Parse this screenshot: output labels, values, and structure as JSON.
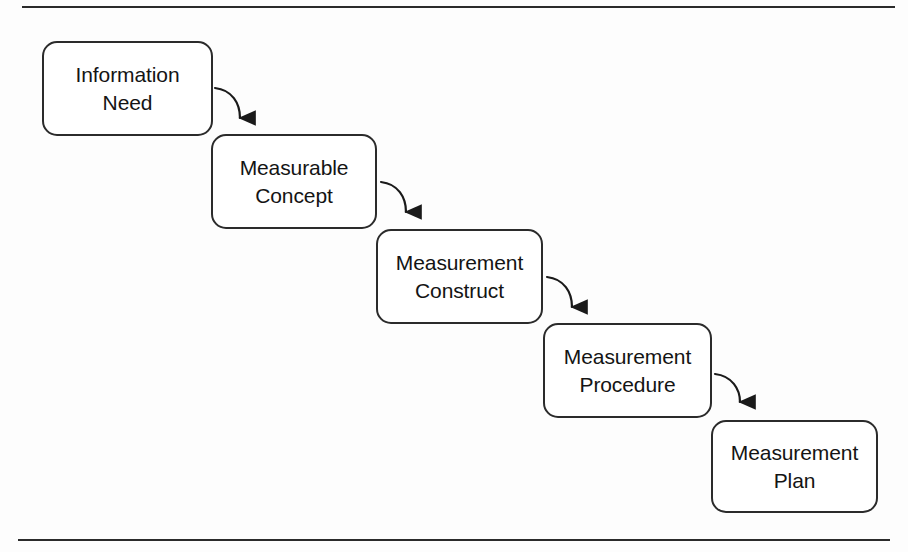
{
  "figure": {
    "background_color": "#fdfdfd",
    "line_color": "#2b2b2b",
    "text_color": "#141414"
  },
  "rules": [
    {
      "name": "top-rule",
      "label": "top horizontal rule"
    },
    {
      "name": "bottom-rule",
      "label": "bottom horizontal rule"
    }
  ],
  "nodes": [
    {
      "id": "information-need",
      "label": "Information\nNeed",
      "line1": "Information",
      "line2": "Need"
    },
    {
      "id": "measurable-concept",
      "label": "Measurable\nConcept",
      "line1": "Measurable",
      "line2": "Concept"
    },
    {
      "id": "measurement-construct",
      "label": "Measurement\nConstruct",
      "line1": "Measurement",
      "line2": "Construct"
    },
    {
      "id": "measurement-procedure",
      "label": "Measurement\nProcedure",
      "line1": "Measurement",
      "line2": "Procedure"
    },
    {
      "id": "measurement-plan",
      "label": "Measurement\nPlan",
      "line1": "Measurement",
      "line2": "Plan"
    }
  ],
  "arrows": [
    {
      "id": "arrow-1",
      "from": "information-need",
      "to": "measurable-concept"
    },
    {
      "id": "arrow-2",
      "from": "measurable-concept",
      "to": "measurement-construct"
    },
    {
      "id": "arrow-3",
      "from": "measurement-construct",
      "to": "measurement-procedure"
    },
    {
      "id": "arrow-4",
      "from": "measurement-procedure",
      "to": "measurement-plan"
    }
  ]
}
